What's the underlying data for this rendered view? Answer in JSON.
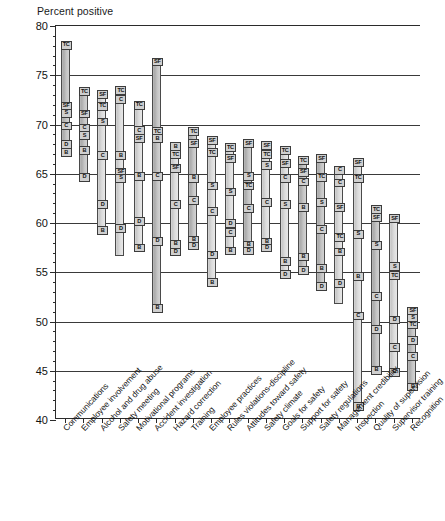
{
  "chart_data": {
    "type": "bar",
    "title": "",
    "subtitle": "",
    "ylabel": "Percent positive",
    "xlabel": "",
    "ylim": [
      40,
      80
    ],
    "ytick_step": 5,
    "yminor_step": 1,
    "grid": true,
    "legend": null,
    "marker_legend": {
      "TC": "TC",
      "SF": "SF",
      "S": "S",
      "C": "C",
      "D": "D",
      "B": "B"
    },
    "categories": [
      "Communications",
      "Employee involvement",
      "Alcohol and drug abuse",
      "Safety meeting",
      "Motivational programs",
      "Accident investigation",
      "Hazard correction",
      "Training",
      "Employee practices",
      "Rules violations-discipline",
      "Attitudes toward safety",
      "Safety climate",
      "Goals for safety",
      "Support for safety",
      "Safety regulations",
      "Management credibility",
      "Inspection",
      "Quality of supervision",
      "Supervisor training",
      "Recognition"
    ],
    "series": [
      {
        "name": "TC",
        "values": [
          78.5,
          73.8,
          72.3,
          73.7,
          72.4,
          69.7,
          68.2,
          68.7,
          67.6,
          67.0,
          66.3,
          67.8,
          65.0,
          63.2,
          63.5,
          61.8,
          57.5,
          54.5,
          52.5,
          50.1
        ]
      },
      {
        "name": "SF",
        "values": [
          72.3,
          71.5,
          73.5,
          73.9,
          69.5,
          76.8,
          68.4,
          68.5,
          68.8,
          68.1,
          68.5,
          68.3,
          67.8,
          66.8,
          65.8,
          61.0,
          59.9,
          60.9,
          56.9,
          51.4
        ]
      },
      {
        "name": "S",
        "values": [
          71.6,
          70.1,
          70.7,
          65.3,
          66.2,
          66.0,
          64.3,
          64.5,
          64.2,
          63.6,
          65.2,
          65.0,
          62.3,
          61.8,
          63.4,
          59.4,
          57.6,
          54.4,
          55.8,
          50.8
        ]
      },
      {
        "name": "C",
        "values": [
          70.3,
          69.8,
          67.3,
          67.3,
          69.8,
          65.2,
          62.3,
          62.7,
          61.6,
          62.4,
          62.5,
          62.5,
          60.2,
          60.0,
          58.6,
          55.2,
          53.0,
          50.0,
          47.5,
          48.1
        ]
      },
      {
        "name": "D",
        "values": [
          68.4,
          65.1,
          62.3,
          59.9,
          65.0,
          60.7,
          58.3,
          58.7,
          58.5,
          59.5,
          58.2,
          58.5,
          56.3,
          57.0,
          55.1,
          52.3,
          50.3,
          52.4,
          50.6,
          49.3
        ]
      },
      {
        "name": "B",
        "values": [
          67.6,
          64.9,
          59.7,
          56.8,
          57.9,
          51.8,
          57.5,
          58.1,
          57.8,
          58.8,
          57.6,
          57.9,
          54.7,
          53.6,
          53.0,
          49.4,
          41.8,
          46.7,
          45.3,
          46.4
        ]
      }
    ],
    "bars": [
      {
        "category": "Communications",
        "top": 78.5,
        "bottom": 67.5,
        "shade": "dark",
        "markers": [
          {
            "label": "TC",
            "value": 78.5
          },
          {
            "label": "SF",
            "value": 72.3
          },
          {
            "label": "S",
            "value": 71.6
          },
          {
            "label": "C",
            "value": 70.3
          },
          {
            "label": "D",
            "value": 68.4
          },
          {
            "label": "B",
            "value": 67.6
          }
        ]
      },
      {
        "category": "Employee involvement",
        "top": 73.8,
        "bottom": 64.8,
        "shade": "dark",
        "markers": [
          {
            "label": "TC",
            "value": 73.8
          },
          {
            "label": "SF",
            "value": 71.5
          },
          {
            "label": "C",
            "value": 70.1
          },
          {
            "label": "S",
            "value": 69.3
          },
          {
            "label": "B",
            "value": 67.8
          },
          {
            "label": "D",
            "value": 65.1
          }
        ]
      },
      {
        "category": "Alcohol and drug abuse",
        "top": 73.5,
        "bottom": 59.5,
        "shade": "light",
        "markers": [
          {
            "label": "SF",
            "value": 73.5
          },
          {
            "label": "TC",
            "value": 72.3
          },
          {
            "label": "S",
            "value": 70.7
          },
          {
            "label": "C",
            "value": 67.3
          },
          {
            "label": "D",
            "value": 62.3
          },
          {
            "label": "B",
            "value": 59.7
          }
        ]
      },
      {
        "category": "Safety meeting",
        "top": 73.9,
        "bottom": 56.6,
        "shade": "light",
        "markers": [
          {
            "label": "TC",
            "value": 73.9
          },
          {
            "label": "C",
            "value": 73.0
          },
          {
            "label": "B",
            "value": 67.3
          },
          {
            "label": "SF",
            "value": 65.6
          },
          {
            "label": "S",
            "value": 65.0
          },
          {
            "label": "D",
            "value": 59.9
          }
        ]
      },
      {
        "category": "Motivational programs",
        "top": 72.4,
        "bottom": 57.7,
        "shade": "light",
        "markers": [
          {
            "label": "TC",
            "value": 72.4
          },
          {
            "label": "C",
            "value": 69.8
          },
          {
            "label": "SF",
            "value": 69.0
          },
          {
            "label": "B",
            "value": 65.2
          },
          {
            "label": "D",
            "value": 60.6
          },
          {
            "label": "B",
            "value": 57.9
          }
        ]
      },
      {
        "category": "Accident investigation",
        "top": 76.8,
        "bottom": 51.6,
        "shade": "dark",
        "markers": [
          {
            "label": "SF",
            "value": 76.8
          },
          {
            "label": "TC",
            "value": 69.7
          },
          {
            "label": "B",
            "value": 69.0
          },
          {
            "label": "C",
            "value": 65.2
          },
          {
            "label": "D",
            "value": 58.6
          },
          {
            "label": "B",
            "value": 51.8
          }
        ]
      },
      {
        "category": "Hazard correction",
        "top": 68.2,
        "bottom": 57.3,
        "shade": "light",
        "markers": [
          {
            "label": "B",
            "value": 68.2
          },
          {
            "label": "TC",
            "value": 67.4
          },
          {
            "label": "SF",
            "value": 66.0
          },
          {
            "label": "C",
            "value": 62.3
          },
          {
            "label": "B",
            "value": 58.3
          },
          {
            "label": "D",
            "value": 57.5
          }
        ]
      },
      {
        "category": "Training",
        "top": 69.7,
        "bottom": 57.9,
        "shade": "dark",
        "markers": [
          {
            "label": "TC",
            "value": 69.7
          },
          {
            "label": "SF",
            "value": 68.5
          },
          {
            "label": "B",
            "value": 65.0
          },
          {
            "label": "C",
            "value": 62.7
          },
          {
            "label": "B",
            "value": 58.7
          },
          {
            "label": "D",
            "value": 58.1
          }
        ]
      },
      {
        "category": "Employee practices",
        "top": 68.8,
        "bottom": 54.2,
        "shade": "light",
        "markers": [
          {
            "label": "SF",
            "value": 68.8
          },
          {
            "label": "TC",
            "value": 67.6
          },
          {
            "label": "S",
            "value": 64.2
          },
          {
            "label": "C",
            "value": 61.6
          },
          {
            "label": "D",
            "value": 57.2
          },
          {
            "label": "B",
            "value": 54.4
          }
        ]
      },
      {
        "category": "Rules violations-discipline",
        "top": 68.1,
        "bottom": 57.4,
        "shade": "light",
        "markers": [
          {
            "label": "TC",
            "value": 68.1
          },
          {
            "label": "SF",
            "value": 67.0
          },
          {
            "label": "S",
            "value": 63.6
          },
          {
            "label": "D",
            "value": 60.4
          },
          {
            "label": "C",
            "value": 59.5
          },
          {
            "label": "B",
            "value": 57.6
          }
        ]
      },
      {
        "category": "Attitudes toward safety",
        "top": 68.5,
        "bottom": 57.3,
        "shade": "dark",
        "markers": [
          {
            "label": "SF",
            "value": 68.5
          },
          {
            "label": "S",
            "value": 65.2
          },
          {
            "label": "TC",
            "value": 64.2
          },
          {
            "label": "C",
            "value": 61.9
          },
          {
            "label": "B",
            "value": 58.2
          },
          {
            "label": "D",
            "value": 57.6
          }
        ]
      },
      {
        "category": "Safety climate",
        "top": 68.3,
        "bottom": 57.7,
        "shade": "light",
        "markers": [
          {
            "label": "SF",
            "value": 68.3
          },
          {
            "label": "TC",
            "value": 67.4
          },
          {
            "label": "S",
            "value": 66.3
          },
          {
            "label": "C",
            "value": 62.5
          },
          {
            "label": "B",
            "value": 58.5
          },
          {
            "label": "D",
            "value": 57.9
          }
        ]
      },
      {
        "category": "Goals for safety",
        "top": 67.8,
        "bottom": 54.6,
        "shade": "light",
        "markers": [
          {
            "label": "TC",
            "value": 67.8
          },
          {
            "label": "SF",
            "value": 66.5
          },
          {
            "label": "C",
            "value": 65.0
          },
          {
            "label": "S",
            "value": 62.3
          },
          {
            "label": "B",
            "value": 56.5
          },
          {
            "label": "D",
            "value": 55.2
          }
        ]
      },
      {
        "category": "Support for safety",
        "top": 66.8,
        "bottom": 55.2,
        "shade": "dark",
        "markers": [
          {
            "label": "TC",
            "value": 66.8
          },
          {
            "label": "SF",
            "value": 65.6
          },
          {
            "label": "C",
            "value": 64.6
          },
          {
            "label": "B",
            "value": 62.0
          },
          {
            "label": "B",
            "value": 57.0
          },
          {
            "label": "D",
            "value": 55.6
          }
        ]
      },
      {
        "category": "Safety regulations",
        "top": 67.0,
        "bottom": 53.5,
        "shade": "dark",
        "markers": [
          {
            "label": "SF",
            "value": 67.0
          },
          {
            "label": "TC",
            "value": 65.1
          },
          {
            "label": "S",
            "value": 62.5
          },
          {
            "label": "C",
            "value": 59.8
          },
          {
            "label": "B",
            "value": 55.8
          },
          {
            "label": "D",
            "value": 54.0
          }
        ]
      },
      {
        "category": "Management credibility",
        "top": 65.8,
        "bottom": 51.8,
        "shade": "light",
        "markers": [
          {
            "label": "C",
            "value": 65.8
          },
          {
            "label": "C",
            "value": 64.5
          },
          {
            "label": "SF",
            "value": 62.0
          },
          {
            "label": "TC",
            "value": 59.0
          },
          {
            "label": "B",
            "value": 57.5
          },
          {
            "label": "D",
            "value": 54.3
          }
        ]
      },
      {
        "category": "Inspection",
        "top": 66.6,
        "bottom": 41.6,
        "shade": "light",
        "markers": [
          {
            "label": "SF",
            "value": 66.6
          },
          {
            "label": "TC",
            "value": 65.0
          },
          {
            "label": "S",
            "value": 59.3
          },
          {
            "label": "B",
            "value": 55.0
          },
          {
            "label": "C",
            "value": 51.0
          },
          {
            "label": "B",
            "value": 41.8
          }
        ]
      },
      {
        "category": "Quality of supervision",
        "top": 61.8,
        "bottom": 45.3,
        "shade": "dark",
        "markers": [
          {
            "label": "TC",
            "value": 61.8
          },
          {
            "label": "SF",
            "value": 61.0
          },
          {
            "label": "S",
            "value": 58.2
          },
          {
            "label": "C",
            "value": 53.0
          },
          {
            "label": "D",
            "value": 49.6
          },
          {
            "label": "B",
            "value": 45.5
          }
        ]
      },
      {
        "category": "Supervisor training",
        "top": 60.9,
        "bottom": 44.9,
        "shade": "light",
        "markers": [
          {
            "label": "SF",
            "value": 60.9
          },
          {
            "label": "S",
            "value": 56.0
          },
          {
            "label": "TC",
            "value": 55.1
          },
          {
            "label": "D",
            "value": 50.6
          },
          {
            "label": "C",
            "value": 47.8
          },
          {
            "label": "B",
            "value": 45.3
          }
        ]
      },
      {
        "category": "Recognition",
        "top": 51.5,
        "bottom": 43.4,
        "shade": "dark",
        "markers": [
          {
            "label": "SF",
            "value": 51.5
          },
          {
            "label": "S",
            "value": 50.8
          },
          {
            "label": "TC",
            "value": 50.1
          },
          {
            "label": "D",
            "value": 48.5
          },
          {
            "label": "C",
            "value": 46.9
          },
          {
            "label": "B",
            "value": 43.8
          }
        ]
      }
    ],
    "ytick_labels": [
      "80",
      "75",
      "70",
      "65",
      "60",
      "55",
      "50",
      "45",
      "40"
    ]
  }
}
